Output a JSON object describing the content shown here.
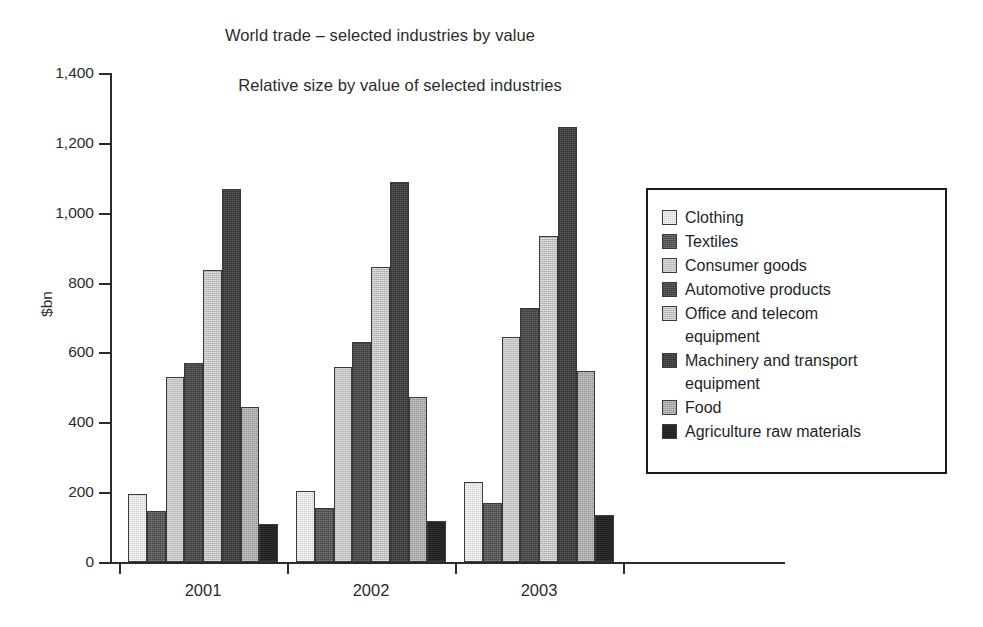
{
  "chart_data": {
    "type": "bar",
    "title": "World trade – selected industries by value",
    "subtitle": "Relative size by value of selected industries",
    "xlabel": "",
    "ylabel": "$bn",
    "ylim": [
      0,
      1400
    ],
    "ytick_step": 200,
    "yticks": [
      "1,400",
      "1,200",
      "1,000",
      "800",
      "600",
      "400",
      "200",
      "0"
    ],
    "ytick_values": [
      1400,
      1200,
      1000,
      800,
      600,
      400,
      200,
      0
    ],
    "grid": false,
    "legend_position": "right",
    "categories": [
      "2001",
      "2002",
      "2003"
    ],
    "series": [
      {
        "name": "Clothing",
        "values": [
          195,
          202,
          228
        ]
      },
      {
        "name": "Textiles",
        "values": [
          147,
          155,
          170
        ]
      },
      {
        "name": "Consumer goods",
        "values": [
          530,
          558,
          643
        ]
      },
      {
        "name": "Automotive products",
        "values": [
          571,
          629,
          726
        ]
      },
      {
        "name": "Office and telecom\nequipment",
        "values": [
          837,
          845,
          932
        ]
      },
      {
        "name": "Machinery and transport\nequipment",
        "values": [
          1069,
          1088,
          1245
        ]
      },
      {
        "name": "Food",
        "values": [
          444,
          473,
          546
        ]
      },
      {
        "name": "Agriculture raw materials",
        "values": [
          110,
          117,
          134
        ]
      }
    ],
    "series_colors": [
      "#d2d2d2",
      "#555555",
      "#c3c3c3",
      "#4a4a4a",
      "#bfbfbf",
      "#414141",
      "#ababab",
      "#1f1f1f"
    ]
  }
}
